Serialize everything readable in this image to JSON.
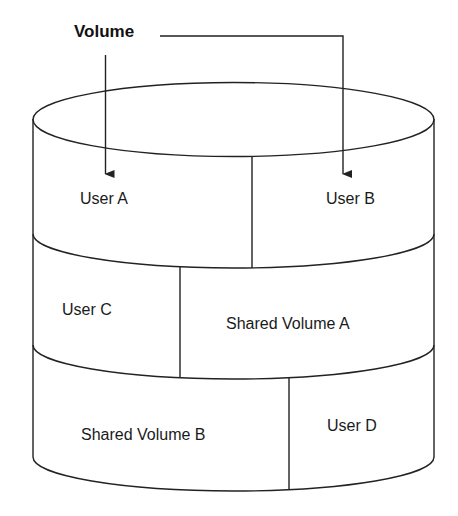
{
  "diagram": {
    "title": "Volume",
    "shape": "cylinder",
    "stroke_color": "#222222",
    "background_color": "#ffffff",
    "arrows_from_title_to": [
      "User A",
      "User B"
    ],
    "tiers": [
      {
        "index": 1,
        "segments": [
          {
            "label": "User A"
          },
          {
            "label": "User B"
          }
        ]
      },
      {
        "index": 2,
        "segments": [
          {
            "label": "User C"
          },
          {
            "label": "Shared Volume A"
          }
        ]
      },
      {
        "index": 3,
        "segments": [
          {
            "label": "Shared Volume B"
          },
          {
            "label": "User D"
          }
        ]
      }
    ]
  }
}
